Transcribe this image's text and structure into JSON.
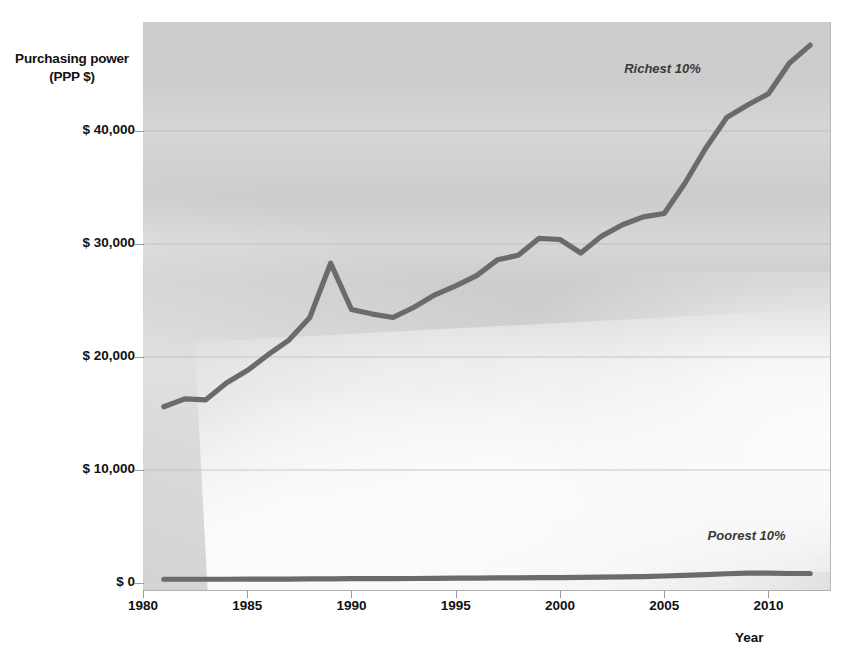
{
  "chart_data": {
    "type": "line",
    "title": "",
    "subtitle": "",
    "xlabel": "Year",
    "ylabel": "Purchasing power\n(PPP $)",
    "ylabel_line1": "Purchasing power",
    "ylabel_line2": "(PPP $)",
    "xlim": [
      1980,
      2013
    ],
    "ylim": [
      0,
      48000
    ],
    "grid": true,
    "legend_position": "inline-annotations",
    "y_ticks": [
      0,
      10000,
      20000,
      30000,
      40000
    ],
    "y_tick_labels": [
      "$ 0",
      "$ 10,000",
      "$ 20,000",
      "$ 30,000",
      "$ 40,000"
    ],
    "x_ticks": [
      1980,
      1985,
      1990,
      1995,
      2000,
      2005,
      2010
    ],
    "x_tick_labels": [
      "1980",
      "1985",
      "1990",
      "1995",
      "2000",
      "2005",
      "2010"
    ],
    "x": [
      1981,
      1982,
      1983,
      1984,
      1985,
      1986,
      1987,
      1988,
      1989,
      1990,
      1991,
      1992,
      1993,
      1994,
      1995,
      1996,
      1997,
      1998,
      1999,
      2000,
      2001,
      2002,
      2003,
      2004,
      2005,
      2006,
      2007,
      2008,
      2009,
      2010,
      2011,
      2012
    ],
    "series": [
      {
        "name": "Richest 10%",
        "color": "#6b6b6b",
        "values": [
          15600,
          16300,
          16200,
          17700,
          18800,
          20200,
          21500,
          23500,
          28300,
          24200,
          23800,
          23500,
          24400,
          25500,
          26300,
          27200,
          28600,
          29000,
          30500,
          30400,
          29200,
          30700,
          31700,
          32400,
          32700,
          35400,
          38500,
          41200,
          42300,
          43300,
          46000,
          47600
        ],
        "label_text": "Richest 10%"
      },
      {
        "name": "Poorest 10%",
        "color": "#6b6b6b",
        "values": [
          330,
          330,
          330,
          330,
          340,
          340,
          350,
          360,
          370,
          380,
          380,
          390,
          400,
          410,
          430,
          440,
          450,
          460,
          470,
          480,
          500,
          520,
          540,
          570,
          620,
          680,
          740,
          820,
          880,
          870,
          840,
          840
        ],
        "label_text": "Poorest 10%"
      }
    ],
    "annotations": [
      {
        "text": "Richest 10%",
        "x": 2005,
        "y": 45500
      },
      {
        "text": "Poorest 10%",
        "x": 2009,
        "y": 4200
      }
    ],
    "colors": {
      "plot_background": "#cfcfcf",
      "line": "#6b6b6b",
      "gridline": "#b3b3b3",
      "text": "#111111",
      "page_background": "#ffffff"
    }
  }
}
